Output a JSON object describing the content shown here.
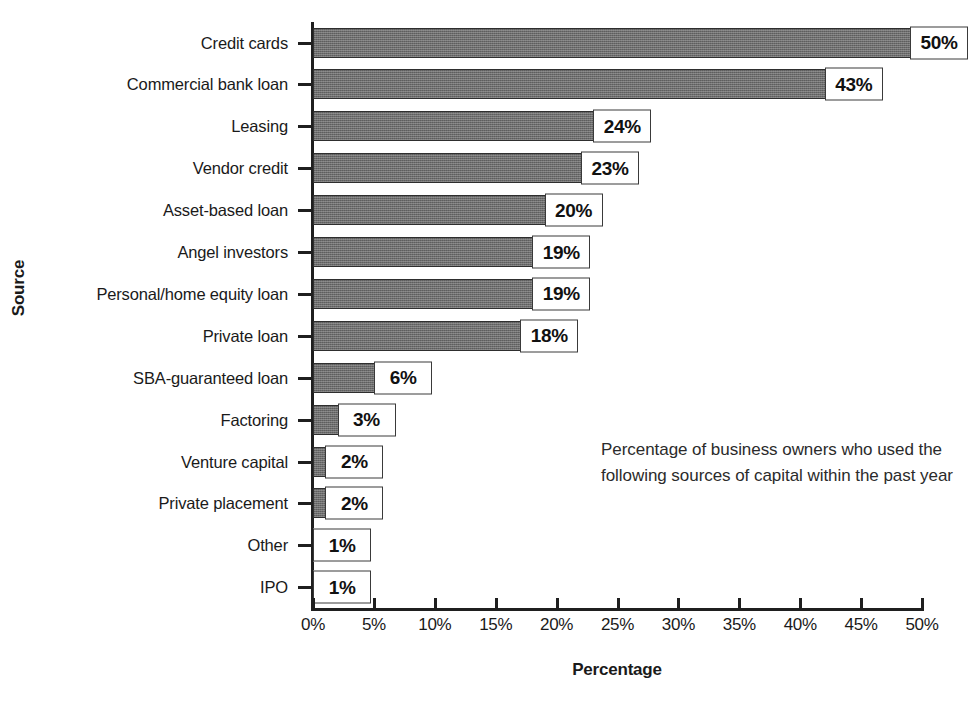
{
  "chart_data": {
    "type": "bar",
    "orientation": "horizontal",
    "title": "",
    "xlabel": "Percentage",
    "ylabel": "Source",
    "xlim": [
      0,
      50
    ],
    "xticks": [
      "0%",
      "5%",
      "10%",
      "15%",
      "20%",
      "25%",
      "30%",
      "35%",
      "40%",
      "45%",
      "50%"
    ],
    "xtick_values": [
      0,
      5,
      10,
      15,
      20,
      25,
      30,
      35,
      40,
      45,
      50
    ],
    "grid": false,
    "legend": false,
    "categories": [
      "Credit cards",
      "Commercial bank loan",
      "Leasing",
      "Vendor credit",
      "Asset-based loan",
      "Angel investors",
      "Personal/home equity loan",
      "Private loan",
      "SBA-guaranteed loan",
      "Factoring",
      "Venture capital",
      "Private placement",
      "Other",
      "IPO"
    ],
    "values": [
      50,
      43,
      24,
      23,
      20,
      19,
      19,
      18,
      6,
      3,
      2,
      2,
      1,
      1
    ],
    "data_labels": [
      "50%",
      "43%",
      "24%",
      "23%",
      "20%",
      "19%",
      "19%",
      "18%",
      "6%",
      "3%",
      "2%",
      "2%",
      "1%",
      "1%"
    ],
    "bar_color": "#6d6d6d",
    "bar_edge_color": "#2e2e2e",
    "label_box_fill": "#ffffff",
    "label_box_border": "#3a3a3a",
    "annotation": "Percentage of business owners who used the following sources of capital within the past year"
  }
}
